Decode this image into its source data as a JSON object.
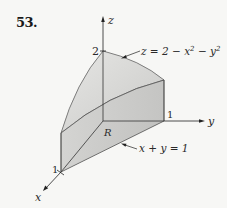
{
  "problem_number": "53.",
  "axes": {
    "z_label": "z",
    "y_label": "y",
    "x_label": "x",
    "z_tick": "2",
    "y_tick": "1",
    "x_tick": "1"
  },
  "annotations": {
    "surface": {
      "lhs": "z = 2 − x",
      "exp1": "2",
      "mid": " − y",
      "exp2": "2"
    },
    "boundary_line": "x + y = 1",
    "region_label": "R"
  },
  "colors": {
    "background": "#f7f7f5",
    "top_surface": "#d9d9d7",
    "front_wall": "#cfcfcd",
    "left_wall": "#c4c4c2",
    "region_base": "#bdbdbb",
    "lines": "#333333"
  }
}
